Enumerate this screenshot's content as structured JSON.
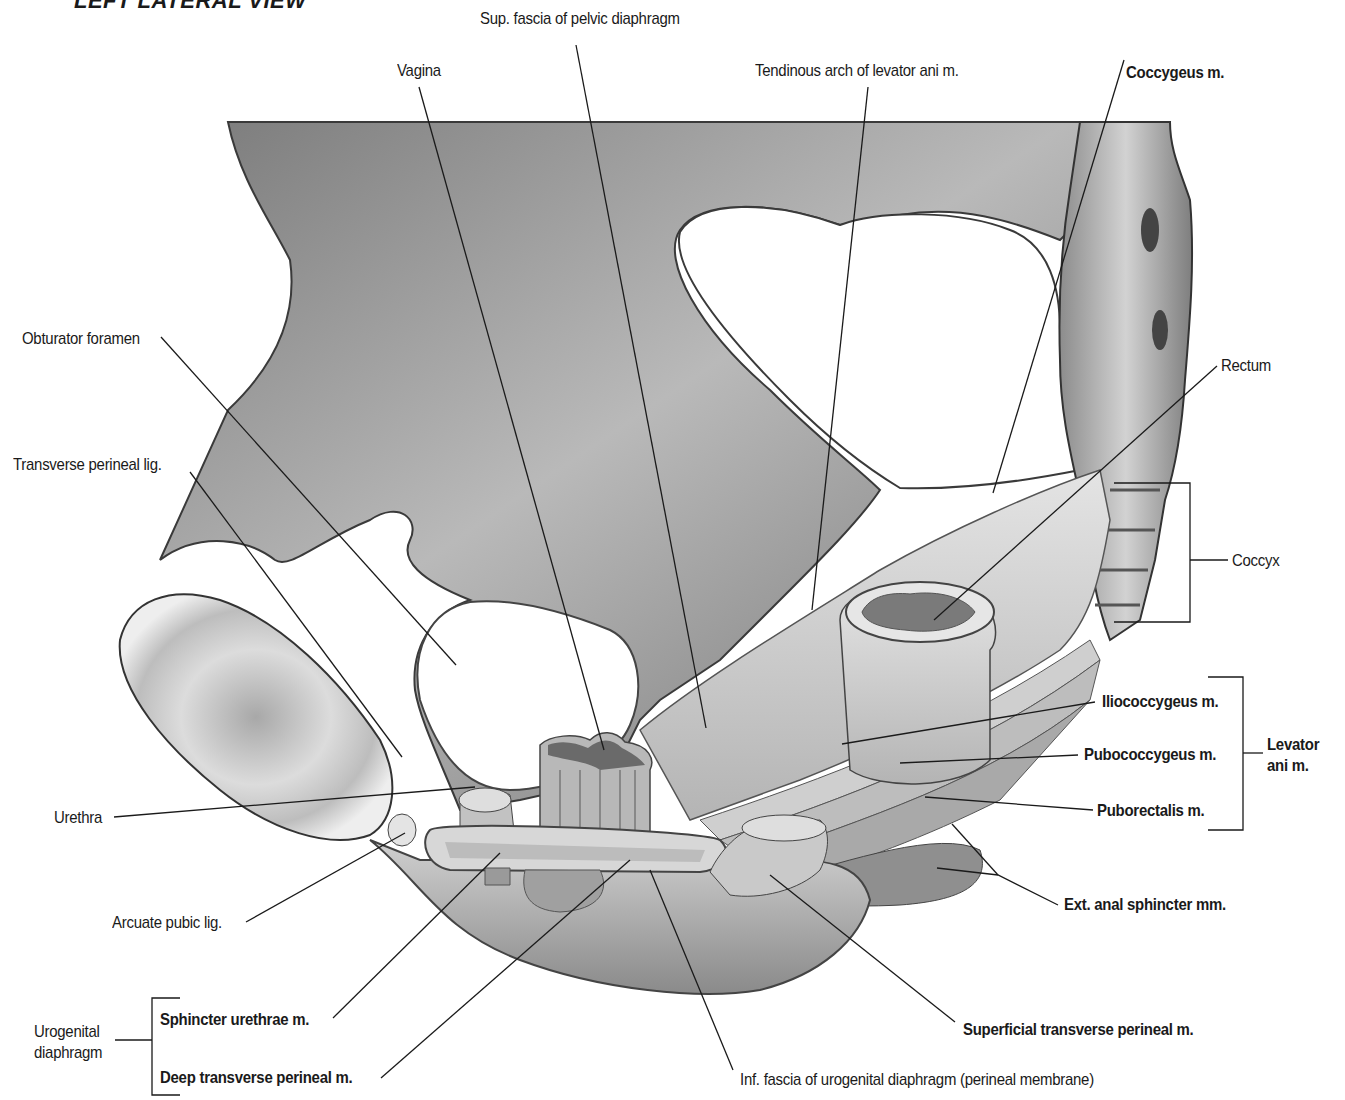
{
  "figure": {
    "view_title": "LEFT LATERAL VIEW"
  },
  "labels": {
    "vagina": "Vagina",
    "sup_fascia": "Sup. fascia of pelvic diaphragm",
    "tendinous_arch": "Tendinous arch of levator ani m.",
    "coccygeus": "Coccygeus m.",
    "obturator_foramen": "Obturator foramen",
    "transverse_perineal_lig": "Transverse perineal lig.",
    "rectum": "Rectum",
    "coccyx": "Coccyx",
    "iliococcygeus": "Iliococcygeus m.",
    "pubococcygeus": "Pubococcygeus m.",
    "puborectalis": "Puborectalis m.",
    "levator_ani_line1": "Levator",
    "levator_ani_line2": "ani m.",
    "urethra": "Urethra",
    "arcuate_pubic_lig": "Arcuate pubic lig.",
    "ext_anal_sphincter": "Ext. anal sphincter mm.",
    "urogenital_line1": "Urogenital",
    "urogenital_line2": "diaphragm",
    "sphincter_urethrae": "Sphincter urethrae m.",
    "deep_transverse_perineal": "Deep transverse perineal m.",
    "superficial_transverse_perineal": "Superficial transverse perineal m.",
    "inf_fascia": "Inf. fascia of urogenital diaphragm (perineal membrane)"
  },
  "groups": {
    "levator_ani": [
      "Iliococcygeus m.",
      "Pubococcygeus m.",
      "Puborectalis m."
    ],
    "urogenital_diaphragm": [
      "Sphincter urethrae m.",
      "Deep transverse perineal m."
    ]
  },
  "colors": {
    "ink": "#1a1a1a",
    "bone_dark": "#6e6e6e",
    "bone_mid": "#9a9a9a",
    "bone_light": "#c9c9c9",
    "muscle_light": "#dcdcdc"
  }
}
